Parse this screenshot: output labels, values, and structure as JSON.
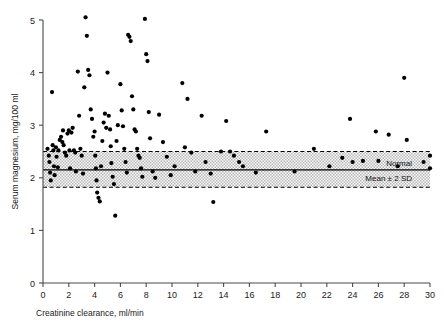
{
  "chart_data": {
    "type": "scatter",
    "title": "",
    "xlabel": "Creatinine clearance, ml/min",
    "ylabel": "Serum magnesium, mg/100 ml",
    "xlim": [
      0,
      30
    ],
    "ylim": [
      0,
      5
    ],
    "xticks": [
      0,
      2,
      4,
      6,
      8,
      10,
      12,
      14,
      16,
      18,
      20,
      22,
      24,
      26,
      28,
      30
    ],
    "yticks": [
      0,
      1,
      2,
      3,
      4,
      5
    ],
    "xtick_labels": [
      "0",
      "2",
      "4",
      "6",
      "8",
      "10",
      "12",
      "14",
      "16",
      "18",
      "20",
      "22",
      "24",
      "26",
      "28",
      "30"
    ],
    "ytick_labels": [
      "0",
      "1",
      "2",
      "3",
      "4",
      "5"
    ],
    "grid": false,
    "legend": "none",
    "point_color": "#000000",
    "point_size": 3,
    "reference_band": {
      "label_upper": "Normal",
      "label_lower": "Mean ± 2 SD",
      "mean": 2.15,
      "upper": 2.5,
      "lower": 1.82,
      "x_start": 0,
      "x_end": 30,
      "fill": "#cfcfcf",
      "edge_style": "dashed",
      "mean_style": "solid"
    },
    "points": [
      [
        0.35,
        2.55
      ],
      [
        0.45,
        2.42
      ],
      [
        0.5,
        2.3
      ],
      [
        0.55,
        2.1
      ],
      [
        0.6,
        1.95
      ],
      [
        0.7,
        3.63
      ],
      [
        0.75,
        2.62
      ],
      [
        0.8,
        2.52
      ],
      [
        0.85,
        2.22
      ],
      [
        0.9,
        2.05
      ],
      [
        1.0,
        2.58
      ],
      [
        1.05,
        2.4
      ],
      [
        1.15,
        2.2
      ],
      [
        1.2,
        2.52
      ],
      [
        1.3,
        2.72
      ],
      [
        1.4,
        2.78
      ],
      [
        1.5,
        2.68
      ],
      [
        1.55,
        2.9
      ],
      [
        1.6,
        2.62
      ],
      [
        1.7,
        2.48
      ],
      [
        1.8,
        2.42
      ],
      [
        1.9,
        2.84
      ],
      [
        2.0,
        2.9
      ],
      [
        2.05,
        2.52
      ],
      [
        2.1,
        2.18
      ],
      [
        2.2,
        2.86
      ],
      [
        2.3,
        2.95
      ],
      [
        2.4,
        2.52
      ],
      [
        2.5,
        2.48
      ],
      [
        2.55,
        2.12
      ],
      [
        2.7,
        4.02
      ],
      [
        2.8,
        3.18
      ],
      [
        2.9,
        2.55
      ],
      [
        3.0,
        2.42
      ],
      [
        3.1,
        2.08
      ],
      [
        3.2,
        3.72
      ],
      [
        3.3,
        5.05
      ],
      [
        3.4,
        4.7
      ],
      [
        3.5,
        4.05
      ],
      [
        3.6,
        3.95
      ],
      [
        3.7,
        3.3
      ],
      [
        3.8,
        3.12
      ],
      [
        3.9,
        2.78
      ],
      [
        4.0,
        2.88
      ],
      [
        4.05,
        2.42
      ],
      [
        4.1,
        2.18
      ],
      [
        4.15,
        1.95
      ],
      [
        4.2,
        1.72
      ],
      [
        4.3,
        1.62
      ],
      [
        4.4,
        1.55
      ],
      [
        4.5,
        2.22
      ],
      [
        4.6,
        2.7
      ],
      [
        4.7,
        3.05
      ],
      [
        4.8,
        3.22
      ],
      [
        4.9,
        2.95
      ],
      [
        5.0,
        4.0
      ],
      [
        5.1,
        3.18
      ],
      [
        5.2,
        2.92
      ],
      [
        5.25,
        2.6
      ],
      [
        5.3,
        2.28
      ],
      [
        5.4,
        2.02
      ],
      [
        5.5,
        1.88
      ],
      [
        5.6,
        1.28
      ],
      [
        5.7,
        2.7
      ],
      [
        5.8,
        3.0
      ],
      [
        6.0,
        3.78
      ],
      [
        6.1,
        3.28
      ],
      [
        6.2,
        2.98
      ],
      [
        6.3,
        2.55
      ],
      [
        6.4,
        2.3
      ],
      [
        6.5,
        2.1
      ],
      [
        6.6,
        4.72
      ],
      [
        6.7,
        4.68
      ],
      [
        6.8,
        4.6
      ],
      [
        6.9,
        3.55
      ],
      [
        7.0,
        3.3
      ],
      [
        7.1,
        2.92
      ],
      [
        7.2,
        2.88
      ],
      [
        7.3,
        2.55
      ],
      [
        7.4,
        2.42
      ],
      [
        7.5,
        2.38
      ],
      [
        7.6,
        2.18
      ],
      [
        7.7,
        2.02
      ],
      [
        7.9,
        5.02
      ],
      [
        8.0,
        4.35
      ],
      [
        8.1,
        4.22
      ],
      [
        8.2,
        3.25
      ],
      [
        8.3,
        2.75
      ],
      [
        8.5,
        2.12
      ],
      [
        8.7,
        2.0
      ],
      [
        9.0,
        3.2
      ],
      [
        9.3,
        2.68
      ],
      [
        9.6,
        2.4
      ],
      [
        9.9,
        2.05
      ],
      [
        10.2,
        2.22
      ],
      [
        10.8,
        3.8
      ],
      [
        11.0,
        2.58
      ],
      [
        11.2,
        3.5
      ],
      [
        11.5,
        2.48
      ],
      [
        11.8,
        2.12
      ],
      [
        12.3,
        3.18
      ],
      [
        12.6,
        2.3
      ],
      [
        13.0,
        2.08
      ],
      [
        13.2,
        1.54
      ],
      [
        13.8,
        2.5
      ],
      [
        14.2,
        3.08
      ],
      [
        14.5,
        2.5
      ],
      [
        14.8,
        2.42
      ],
      [
        15.2,
        2.3
      ],
      [
        15.5,
        2.22
      ],
      [
        16.5,
        2.1
      ],
      [
        17.3,
        2.88
      ],
      [
        19.5,
        2.12
      ],
      [
        21.0,
        2.55
      ],
      [
        22.2,
        2.22
      ],
      [
        23.2,
        2.38
      ],
      [
        23.8,
        3.12
      ],
      [
        24.0,
        2.3
      ],
      [
        24.8,
        2.32
      ],
      [
        25.8,
        2.88
      ],
      [
        26.0,
        2.32
      ],
      [
        26.8,
        2.82
      ],
      [
        27.5,
        2.22
      ],
      [
        28.0,
        3.9
      ],
      [
        28.2,
        2.72
      ],
      [
        29.5,
        2.3
      ],
      [
        30.0,
        2.42
      ],
      [
        30.0,
        2.18
      ]
    ]
  }
}
